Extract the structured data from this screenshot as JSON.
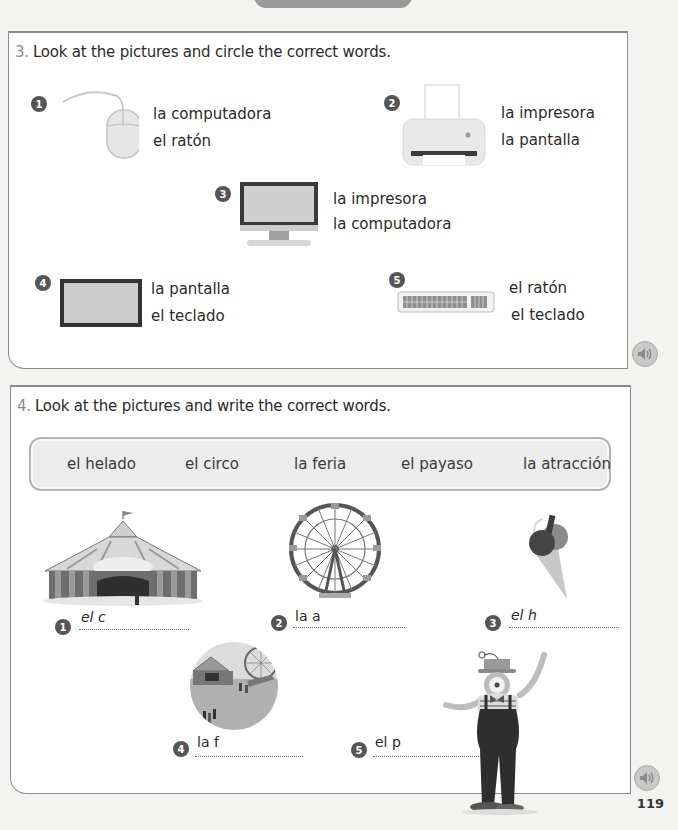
{
  "page": {
    "number": "119"
  },
  "exercise3": {
    "number": "3.",
    "instruction": "Look at the pictures and circle the correct words.",
    "items": [
      {
        "badge": "1",
        "picture": "computer-mouse",
        "options": [
          "la computadora",
          "el ratón"
        ]
      },
      {
        "badge": "2",
        "picture": "printer",
        "options": [
          "la impresora",
          "la pantalla"
        ]
      },
      {
        "badge": "3",
        "picture": "desktop-computer",
        "options": [
          "la impresora",
          "la computadora"
        ]
      },
      {
        "badge": "4",
        "picture": "screen",
        "options": [
          "la pantalla",
          "el teclado"
        ]
      },
      {
        "badge": "5",
        "picture": "keyboard",
        "options": [
          "el ratón",
          "el teclado"
        ]
      }
    ],
    "audio_icon": "speaker-icon"
  },
  "exercise4": {
    "number": "4.",
    "instruction": "Look at the pictures and write the correct words.",
    "word_bank": [
      "el helado",
      "el circo",
      "la feria",
      "el payaso",
      "la atracción"
    ],
    "items": [
      {
        "badge": "1",
        "picture": "circus-tent",
        "prompt": "el c"
      },
      {
        "badge": "2",
        "picture": "ferris-wheel",
        "prompt": "la a"
      },
      {
        "badge": "3",
        "picture": "ice-cream-cone",
        "prompt": "el h"
      },
      {
        "badge": "4",
        "picture": "fairground",
        "prompt": "la f"
      },
      {
        "badge": "5",
        "picture": "clown",
        "prompt": "el p"
      }
    ],
    "audio_icon": "speaker-icon"
  }
}
